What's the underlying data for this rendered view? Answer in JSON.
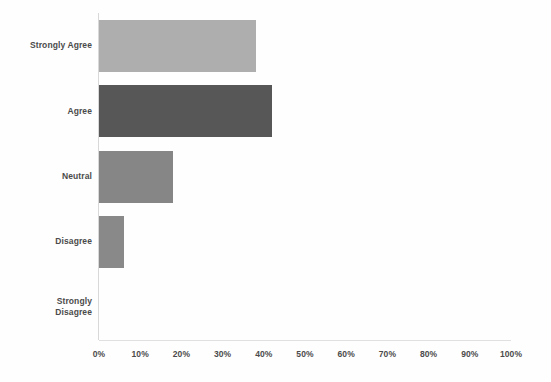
{
  "chart_data": {
    "type": "bar",
    "orientation": "horizontal",
    "title": "",
    "subtitle": "",
    "xlabel": "",
    "ylabel": "",
    "categories": [
      "Strongly Agree",
      "Agree",
      "Neutral",
      "Disagree",
      "Strongly Disagree"
    ],
    "values": [
      38,
      42,
      18,
      6,
      0
    ],
    "value_format": "percent",
    "xlim": [
      0,
      100
    ],
    "ticks": [
      "0%",
      "10%",
      "20%",
      "30%",
      "40%",
      "50%",
      "60%",
      "70%",
      "80%",
      "90%",
      "100%"
    ],
    "tick_values": [
      0,
      10,
      20,
      30,
      40,
      50,
      60,
      70,
      80,
      90,
      100
    ],
    "grid": false,
    "legend": false,
    "legend_position": "none",
    "bar_colors": [
      "#a8a8a8",
      "#4a4a4a",
      "#7d7d7d",
      "#808080",
      "#808080"
    ],
    "series": [
      {
        "name": "Response share",
        "points": [
          {
            "category": "Strongly Agree",
            "label_line1": "Strongly Agree",
            "label_line2": "",
            "value": 38,
            "color": "#a8a8a8"
          },
          {
            "category": "Agree",
            "label_line1": "Agree",
            "label_line2": "",
            "value": 42,
            "color": "#4a4a4a"
          },
          {
            "category": "Neutral",
            "label_line1": "Neutral",
            "label_line2": "",
            "value": 18,
            "color": "#7d7d7d"
          },
          {
            "category": "Disagree",
            "label_line1": "Disagree",
            "label_line2": "",
            "value": 6,
            "color": "#808080"
          },
          {
            "category": "Strongly Disagree",
            "label_line1": "Strongly",
            "label_line2": "Disagree",
            "value": 0,
            "color": "#808080"
          }
        ]
      }
    ]
  },
  "axis": {
    "baseline_color": "#e0e0e0",
    "category_axis_color": "#d8d8d8"
  }
}
